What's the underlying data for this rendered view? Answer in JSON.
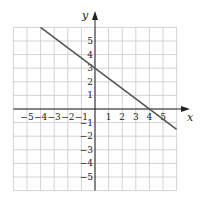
{
  "chart_data": {
    "type": "line",
    "title": "",
    "xlabel": "x",
    "ylabel": "y",
    "xlim": [
      -6,
      6
    ],
    "ylim": [
      -6,
      6
    ],
    "grid": true,
    "x_ticks": [
      "-5",
      "-4",
      "-3",
      "-2",
      "-1",
      "1",
      "2",
      "3",
      "4",
      "5"
    ],
    "y_ticks": [
      "5",
      "4",
      "3",
      "2",
      "1",
      "-1",
      "-2",
      "-3",
      "-4",
      "-5"
    ],
    "series": [
      {
        "name": "line",
        "equation": "y = -3/4 x + 3",
        "x": [
          -4,
          6
        ],
        "y": [
          6,
          -1.5
        ],
        "color": "#555555"
      }
    ],
    "key_points": [
      {
        "x": 0,
        "y": 3,
        "label": "y-intercept"
      },
      {
        "x": 4,
        "y": 0,
        "label": "x-intercept"
      }
    ]
  },
  "colors": {
    "grid": "#c8c8c8",
    "axis": "#222222",
    "line": "#555555"
  }
}
